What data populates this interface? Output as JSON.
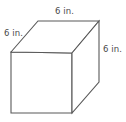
{
  "figure": {
    "name": "cube-diagram",
    "shape": "cube",
    "stroke_color": "#595959",
    "background_color": "#ffffff",
    "labels": {
      "top_edge": "6 in.",
      "left_edge": "6 in.",
      "right_edge": "6 in."
    },
    "geometry": {
      "front_face": "11,52 72,53 72,113 11,113",
      "top_face": "11,52 38,21 99,21 72,53",
      "right_face": "72,53 99,21 99,82 72,113"
    }
  }
}
